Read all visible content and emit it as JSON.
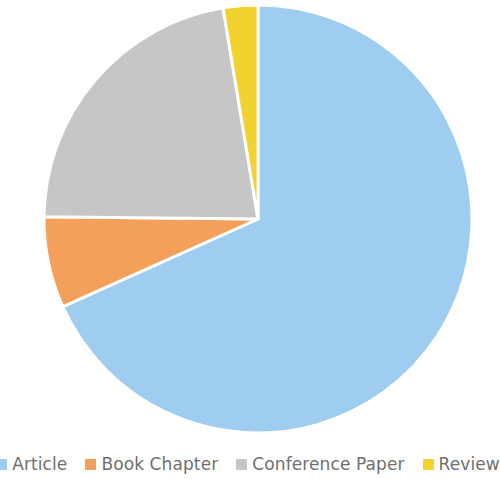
{
  "chart_data": {
    "type": "pie",
    "title": "",
    "subtitle": "",
    "xlabel": "",
    "ylabel": "",
    "grid": false,
    "legend_position": "bottom",
    "start_angle_deg": 0,
    "direction": "clockwise",
    "categories": [
      "Article",
      "Book Chapter",
      "Conference Paper",
      "Review"
    ],
    "values": [
      68.3,
      6.9,
      22.2,
      2.6
    ],
    "units": "percent",
    "colors": [
      "#9fcdf0",
      "#f4a05a",
      "#c6c6c6",
      "#f2d22e"
    ],
    "slices": [
      {
        "label": "Article",
        "value": 68.3,
        "color": "#9fcdf0",
        "start_angle_deg": 0,
        "end_angle_deg": 245.8
      },
      {
        "label": "Book Chapter",
        "value": 6.9,
        "color": "#f4a05a",
        "start_angle_deg": 245.8,
        "end_angle_deg": 270.6
      },
      {
        "label": "Conference Paper",
        "value": 22.2,
        "color": "#c6c6c6",
        "start_angle_deg": 270.6,
        "end_angle_deg": 350.6
      },
      {
        "label": "Review",
        "value": 2.6,
        "color": "#f2d22e",
        "start_angle_deg": 350.6,
        "end_angle_deg": 360
      }
    ],
    "geometry": {
      "center_x": 258,
      "center_y": 219,
      "radius": 214,
      "slice_gap_px": 3
    }
  },
  "legend": {
    "items": [
      {
        "label": "Article",
        "color": "#9fcdf0"
      },
      {
        "label": "Book Chapter",
        "color": "#f4a05a"
      },
      {
        "label": "Conference Paper",
        "color": "#c6c6c6"
      },
      {
        "label": "Review",
        "color": "#f2d22e"
      }
    ]
  },
  "palette": {
    "background": "#ffffff",
    "legend_text": "#6f6f6f",
    "slice_separator": "#ffffff"
  }
}
